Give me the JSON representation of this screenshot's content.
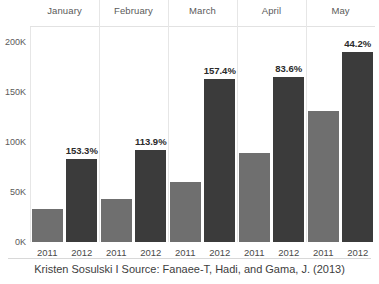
{
  "chart_data": {
    "type": "bar",
    "title": "",
    "subtitle": "",
    "xlabel": "",
    "ylabel": "",
    "ylim": [
      0,
      215000
    ],
    "grid": false,
    "legend_position": "none",
    "facet_label": "month",
    "categories": [
      "2011",
      "2012"
    ],
    "facets": [
      {
        "name": "January",
        "points": [
          {
            "category": "2011",
            "value": 33000,
            "series": "2011"
          },
          {
            "category": "2012",
            "value": 83500,
            "series": "2012"
          }
        ],
        "annotation": "153.3%"
      },
      {
        "name": "February",
        "points": [
          {
            "category": "2011",
            "value": 43000,
            "series": "2011"
          },
          {
            "category": "2012",
            "value": 92000,
            "series": "2012"
          }
        ],
        "annotation": "113.9%"
      },
      {
        "name": "March",
        "points": [
          {
            "category": "2011",
            "value": 60500,
            "series": "2011"
          },
          {
            "category": "2012",
            "value": 163000,
            "series": "2012"
          }
        ],
        "annotation": "157.4%"
      },
      {
        "name": "April",
        "points": [
          {
            "category": "2011",
            "value": 89000,
            "series": "2011"
          },
          {
            "category": "2012",
            "value": 165000,
            "series": "2012"
          }
        ],
        "annotation": "83.6%"
      },
      {
        "name": "May",
        "points": [
          {
            "category": "2011",
            "value": 131000,
            "series": "2011"
          },
          {
            "category": "2012",
            "value": 190000,
            "series": "2012"
          }
        ],
        "annotation": "44.2%"
      }
    ],
    "yticks": [
      {
        "value": 0,
        "label": "0K"
      },
      {
        "value": 50000,
        "label": "50K"
      },
      {
        "value": 100000,
        "label": "100K"
      },
      {
        "value": 150000,
        "label": "150K"
      },
      {
        "value": 200000,
        "label": "200K"
      }
    ],
    "colors": {
      "bar_2011": "#6f6f6f",
      "bar_2012": "#3b3b3b",
      "axis": "#e6e6e6",
      "text": "#5a5a5a",
      "label_text": "#2b2b2b"
    }
  },
  "caption": {
    "text": "Kristen Sosulski I Source: Fanaee-T, Hadi, and Gama, J. (2013)"
  }
}
